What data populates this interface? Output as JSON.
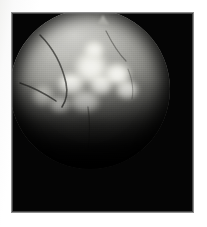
{
  "figure": {
    "kind": "medical-imaging-photograph",
    "modality_appearance": "grayscale radiographic / endoscopic circular field of view",
    "caption": "",
    "label": "",
    "page_background_color": "#ffffff",
    "frame": {
      "background_color": "#050505",
      "border_color": "#8d8d8d",
      "x": 11,
      "y": 12,
      "width": 183,
      "height": 201
    },
    "field_of_view": {
      "shape": "circle",
      "center_x": 89,
      "center_y": 88,
      "radius": 80,
      "rim_color": "#0a0a0a"
    },
    "tones": {
      "brightest": "#f6f6f3",
      "tissue_midtone": "#a9a9a4",
      "tissue_shadow": "#4d4d4a",
      "background_black": "#050505",
      "vessel_dark": "#2b2b28"
    },
    "features": [
      {
        "name": "central-bright-mass",
        "description": "irregular multi-lobed hyperdense mass near center",
        "brightness": "highest"
      },
      {
        "name": "superior-apex-bump",
        "description": "small conical protrusion at top of the circular field"
      },
      {
        "name": "upper-left-fissure-line",
        "description": "thin dark curving line descending from upper-left"
      },
      {
        "name": "left-peripheral-bright-patch",
        "description": "secondary bright patch on the left margin"
      },
      {
        "name": "inferior-dark-zone",
        "description": "lower half fades progressively to black"
      },
      {
        "name": "granular-parenchyma-texture",
        "description": "fine mottled scan grain across the disc"
      }
    ]
  }
}
